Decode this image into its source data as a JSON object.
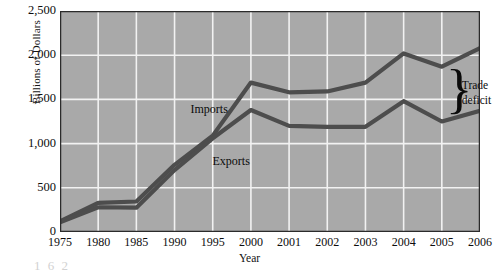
{
  "figure": {
    "caption_fragment": "1 6 2",
    "bg_color": "#ffffff",
    "plot_bg_color": "#a9a9a9",
    "grid_color": "#f2f2f2",
    "line_color": "#4d4d4d",
    "axis_color": "#2b2b2b"
  },
  "annotations": {
    "trade_deficit_line1": "Trade",
    "trade_deficit_line2": "deficit",
    "brace_glyph": "}"
  },
  "chart_data": {
    "type": "line",
    "title": "",
    "xlabel": "Year",
    "ylabel": "Billions of Dollars",
    "categories": [
      "1975",
      "1980",
      "1985",
      "1990",
      "1995",
      "2000",
      "2001",
      "2002",
      "2003",
      "2004",
      "2005",
      "2006"
    ],
    "x_values": [
      1975,
      1980,
      1985,
      1990,
      1995,
      2000,
      2001,
      2002,
      2003,
      2004,
      2005,
      2006
    ],
    "xtick_labels": [
      "1975",
      "1980",
      "1985",
      "1990",
      "1995",
      "2000",
      "2001",
      "2002",
      "2003",
      "2004",
      "2005",
      "2006"
    ],
    "ytick_labels": [
      "0",
      "500",
      "1,000",
      "1,500",
      "2,000",
      "2,500"
    ],
    "ytick_values": [
      0,
      500,
      1000,
      1500,
      2000,
      2500
    ],
    "ylim": [
      0,
      2500
    ],
    "grid": true,
    "legend": "inline-labels",
    "series": [
      {
        "name": "Imports",
        "label": "Imports",
        "values": [
          120,
          330,
          345,
          760,
          1090,
          1690,
          1580,
          1590,
          1690,
          2020,
          1870,
          2080
        ]
      },
      {
        "name": "Exports",
        "label": "Exports",
        "values": [
          110,
          280,
          275,
          700,
          1060,
          1380,
          1200,
          1190,
          1190,
          1480,
          1250,
          1370
        ]
      }
    ]
  }
}
